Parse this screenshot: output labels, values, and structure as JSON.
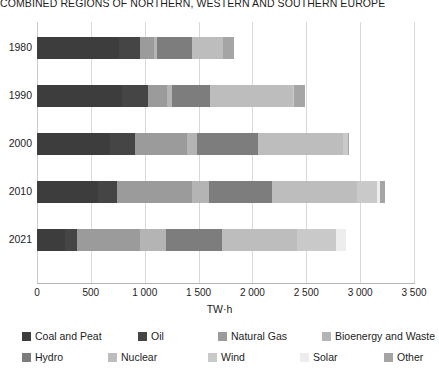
{
  "chart_data": {
    "type": "bar",
    "orientation": "horizontal",
    "stacked": true,
    "title": "COMBINED REGIONS OF NORTHERN, WESTERN AND SOUTHERN EUROPE",
    "xlabel": "TW·h",
    "ylabel": "",
    "xlim": [
      0,
      3500
    ],
    "xticks": [
      0,
      500,
      1000,
      1500,
      2000,
      2500,
      3000,
      3500
    ],
    "xtick_labels": [
      "0",
      "500",
      "1 000",
      "1 500",
      "2 000",
      "2 500",
      "3 000",
      "3 500"
    ],
    "grid": true,
    "legend_position": "bottom",
    "categories": [
      "1980",
      "1990",
      "2000",
      "2010",
      "2021"
    ],
    "series": [
      {
        "name": "Coal and Peat",
        "color": "#3d3d3d",
        "values": [
          760,
          790,
          680,
          565,
          260
        ]
      },
      {
        "name": "Oil",
        "color": "#454545",
        "values": [
          200,
          240,
          230,
          175,
          110
        ]
      },
      {
        "name": "Natural Gas",
        "color": "#9b9b9b",
        "values": [
          130,
          175,
          480,
          695,
          590
        ]
      },
      {
        "name": "Bioenergy and Waste",
        "color": "#b4b4b4",
        "values": [
          20,
          45,
          100,
          165,
          235
        ]
      },
      {
        "name": "Hydro",
        "color": "#7d7d7d",
        "values": [
          330,
          360,
          565,
          585,
          520
        ]
      },
      {
        "name": "Nuclear",
        "color": "#bdbdbd",
        "values": [
          290,
          770,
          790,
          790,
          700
        ]
      },
      {
        "name": "Wind",
        "color": "#c9c9c9",
        "values": [
          0,
          10,
          40,
          185,
          365
        ]
      },
      {
        "name": "Solar",
        "color": "#ededed",
        "values": [
          0,
          0,
          0,
          25,
          90
        ]
      },
      {
        "name": "Other",
        "color": "#a5a5a5",
        "values": [
          100,
          100,
          15,
          45,
          0
        ]
      }
    ],
    "totals": [
      1830,
      2490,
      2900,
      3230,
      2870
    ]
  },
  "legend": {
    "items": [
      {
        "label": "Coal and Peat"
      },
      {
        "label": "Oil"
      },
      {
        "label": "Natural Gas"
      },
      {
        "label": "Bioenergy and Waste"
      },
      {
        "label": "Hydro"
      },
      {
        "label": "Nuclear"
      },
      {
        "label": "Wind"
      },
      {
        "label": "Solar"
      },
      {
        "label": "Other"
      }
    ]
  },
  "colors": {
    "grid": "#d9d9d9",
    "text": "#1d1d1d",
    "background": "#ffffff"
  }
}
